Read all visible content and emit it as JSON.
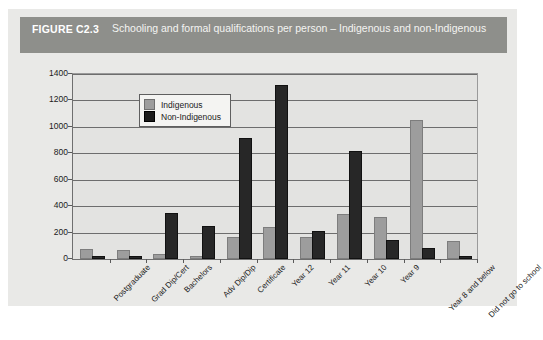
{
  "figure": {
    "number": "FIGURE C2.3",
    "title": "Schooling and formal qualifications per person – Indigenous and non-Indigenous"
  },
  "colors": {
    "header_bg": "#8e8f8b",
    "card_bg": "#e9e9e7",
    "plot_bg": "#e3e3e1",
    "indigenous": "#9d9d9d",
    "non_indigenous": "#272727",
    "gridline": "#6d6d6d",
    "axis": "#5a5a5a"
  },
  "chart_data": {
    "type": "bar",
    "title": "Schooling and formal qualifications per person – Indigenous and non-Indigenous",
    "xlabel": "",
    "ylabel": "",
    "ylim": [
      0,
      1400
    ],
    "yticks": [
      0,
      200,
      400,
      600,
      800,
      1000,
      1200,
      1400
    ],
    "ytick_labels": [
      "0",
      "200",
      "400",
      "600",
      "800",
      "1000",
      "1200",
      "1400"
    ],
    "grid": true,
    "legend_position": "top-left-inside",
    "categories": [
      "Postgraduate",
      "Grad Dip/Cert",
      "Bachelors",
      "Adv Dip/Dip",
      "Certificate",
      "Year 12",
      "Year 11",
      "Year 10",
      "Year 9",
      "Year 8 and below",
      "Did not go to school"
    ],
    "series": [
      {
        "name": "Indigenous",
        "color": "#9d9d9d",
        "values": [
          60,
          50,
          20,
          10,
          155,
          225,
          155,
          325,
          300,
          1040,
          120
        ]
      },
      {
        "name": "Non-Indigenous",
        "color": "#272727",
        "values": [
          5,
          5,
          330,
          235,
          900,
          1300,
          200,
          800,
          130,
          65,
          10
        ]
      }
    ]
  }
}
